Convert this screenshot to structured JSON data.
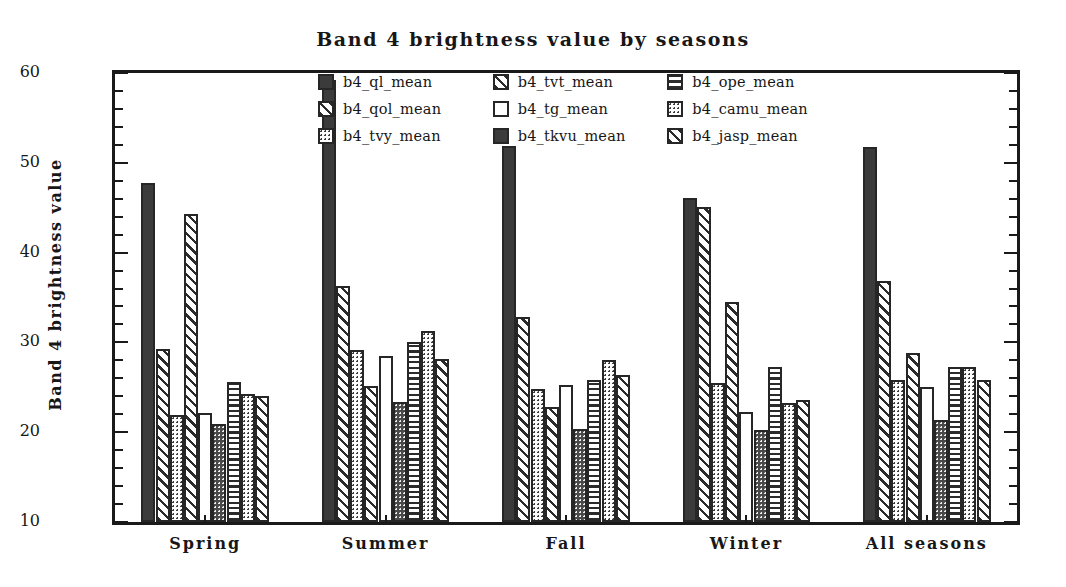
{
  "chart_data": {
    "type": "bar",
    "title": "Band 4 brightness value by seasons",
    "xlabel": "",
    "ylabel": "Band 4 brightness value",
    "ylim": [
      10,
      60
    ],
    "ytick_labels": [
      "10",
      "20",
      "30",
      "40",
      "50",
      "60"
    ],
    "ytick_values": [
      10,
      20,
      30,
      40,
      50,
      60
    ],
    "minor_tick_step": 2,
    "grid": false,
    "legend_position": "upper-center-inside",
    "categories": [
      "Spring",
      "Summer",
      "Fall",
      "Winter",
      "All seasons"
    ],
    "series": [
      {
        "name": "b4_ql_mean",
        "pattern": "solid",
        "values": [
          47.8,
          59.2,
          51.9,
          46.1,
          51.8
        ]
      },
      {
        "name": "b4_qol_mean",
        "pattern": "diagonal",
        "values": [
          29.3,
          36.3,
          32.8,
          45.1,
          36.8
        ]
      },
      {
        "name": "b4_tvy_mean",
        "pattern": "dotted",
        "values": [
          21.9,
          29.2,
          24.8,
          25.5,
          25.8
        ]
      },
      {
        "name": "b4_tvt_mean",
        "pattern": "diagonal",
        "values": [
          44.3,
          25.1,
          22.8,
          34.5,
          28.8
        ]
      },
      {
        "name": "b4_tg_mean",
        "pattern": "empty",
        "values": [
          22.1,
          28.5,
          25.3,
          22.2,
          25.0
        ]
      },
      {
        "name": "b4_tkvu_mean",
        "pattern": "dark-dotted",
        "values": [
          20.9,
          23.4,
          20.4,
          20.3,
          21.4
        ]
      },
      {
        "name": "b4_ope_mean",
        "pattern": "horizontal",
        "values": [
          25.6,
          30.1,
          25.8,
          27.3,
          27.3
        ]
      },
      {
        "name": "b4_camu_mean",
        "pattern": "dotted",
        "values": [
          24.2,
          31.3,
          28.0,
          23.3,
          27.3
        ]
      },
      {
        "name": "b4_jasp_mean",
        "pattern": "diagonal",
        "values": [
          24.0,
          28.2,
          26.4,
          23.6,
          25.8
        ]
      }
    ]
  },
  "legend": {
    "items": [
      {
        "label": "b4_ql_mean",
        "pattern": "solid"
      },
      {
        "label": "b4_tvt_mean",
        "pattern": "diagonal"
      },
      {
        "label": "b4_ope_mean",
        "pattern": "horizontal"
      },
      {
        "label": "b4_qol_mean",
        "pattern": "diagonal"
      },
      {
        "label": "b4_tg_mean",
        "pattern": "empty"
      },
      {
        "label": "b4_camu_mean",
        "pattern": "dotted"
      },
      {
        "label": "b4_tvy_mean",
        "pattern": "dotted"
      },
      {
        "label": "b4_tkvu_mean",
        "pattern": "solid"
      },
      {
        "label": "b4_jasp_mean",
        "pattern": "diagonal"
      }
    ]
  },
  "colors": {
    "ink": "#1a1a1a",
    "bar_outline": "#262626",
    "bar_solid_fill": "#3b3b3b",
    "background": "#ffffff"
  }
}
